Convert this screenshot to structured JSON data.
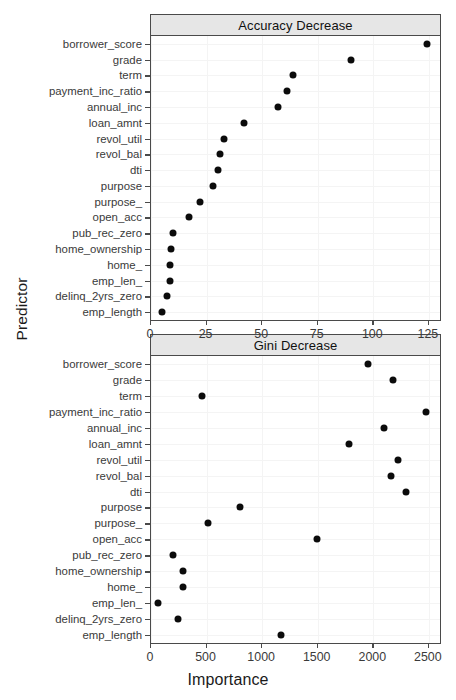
{
  "figure": {
    "xlabel": "Importance",
    "ylabel": "Predictor",
    "point_color": "#0b0b0b",
    "strip_color": "#e6e6e6",
    "border_color": "#4a4a4a",
    "grid_color": "#f4f4f4"
  },
  "chart_data": [
    {
      "type": "scatter",
      "title": "Accuracy Decrease",
      "panel": "top",
      "xlabel": "Importance",
      "ylabel": "Predictor",
      "xlim": [
        0,
        130
      ],
      "xticks": [
        0,
        25,
        50,
        75,
        100,
        125
      ],
      "xticklabels": [
        "0",
        "25",
        "50",
        "75",
        "100",
        "125"
      ],
      "grid": true,
      "legend": "none",
      "categories": [
        "borrower_score",
        "grade",
        "term",
        "payment_inc_ratio",
        "annual_inc",
        "loan_amnt",
        "revol_util",
        "revol_bal",
        "dti",
        "purpose",
        "purpose_",
        "open_acc",
        "pub_rec_zero",
        "home_ownership",
        "home_",
        "emp_len_",
        "delinq_2yrs_zero",
        "emp_length"
      ],
      "values": [
        124,
        90,
        64,
        61,
        57,
        42,
        33,
        31,
        30,
        28,
        22,
        17,
        10,
        9,
        8.5,
        8.5,
        7,
        5
      ]
    },
    {
      "type": "scatter",
      "title": "Gini Decrease",
      "panel": "bottom",
      "xlabel": "Importance",
      "ylabel": "Predictor",
      "xlim": [
        0,
        2600
      ],
      "xticks": [
        0,
        500,
        1000,
        1500,
        2000,
        2500
      ],
      "xticklabels": [
        "0",
        "500",
        "1000",
        "1500",
        "2000",
        "2500"
      ],
      "grid": true,
      "legend": "none",
      "categories": [
        "borrower_score",
        "grade",
        "term",
        "payment_inc_ratio",
        "annual_inc",
        "loan_amnt",
        "revol_util",
        "revol_bal",
        "dti",
        "purpose",
        "purpose_",
        "open_acc",
        "pub_rec_zero",
        "home_ownership",
        "home_",
        "emp_len_",
        "delinq_2yrs_zero",
        "emp_length"
      ],
      "values": [
        1950,
        2180,
        455,
        2470,
        2100,
        1780,
        2220,
        2160,
        2290,
        800,
        510,
        1490,
        200,
        290,
        285,
        60,
        245,
        1170
      ]
    }
  ]
}
